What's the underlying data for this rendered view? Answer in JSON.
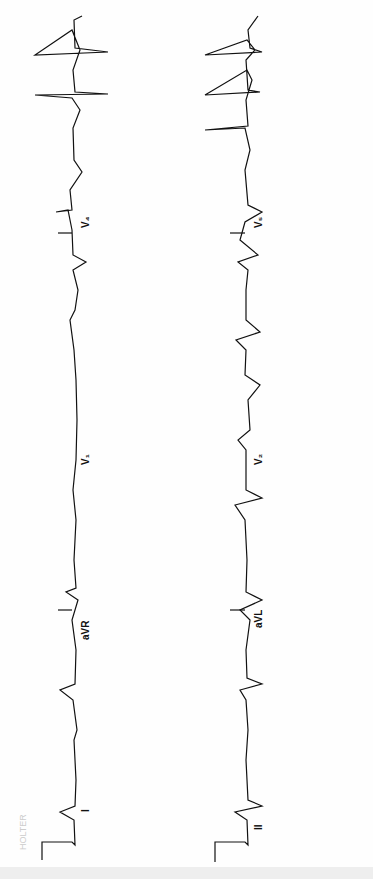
{
  "image": {
    "description": "12-lead ECG excerpt rotated 90 degrees, two rhythm strips",
    "strips": [
      {
        "name": "upper",
        "leads": [
          "I",
          "aVR",
          "V1",
          "V4"
        ]
      },
      {
        "name": "lower",
        "leads": [
          "II",
          "aVL",
          "V2",
          "V5"
        ]
      }
    ],
    "labels": {
      "I": "I",
      "aVR": "aVR",
      "V1": "V₁",
      "V4": "V₄",
      "II": "II",
      "aVL": "aVL",
      "V2": "V₂",
      "V5": "V₅"
    },
    "stamp": "HOLTER"
  }
}
